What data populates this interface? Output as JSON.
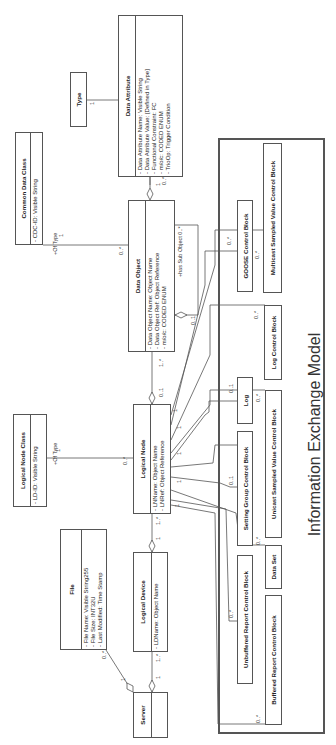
{
  "diagram": {
    "title": "Information Exchange Model",
    "classes": {
      "data_attribute": {
        "name": "Data Attribute",
        "attributes": [
          "-  Data Attribute Name:  Visible String",
          "-  Data Attribute Value:  [Defined in Type]",
          "-  Functional Constraint:  FC",
          "-  m/o/c:  CODED ENUM",
          "-  TrioOp:  Trigger Condition"
        ]
      },
      "type": {
        "name": "Type"
      },
      "common_data_class": {
        "name": "Common Data Class",
        "attributes": [
          "-  CDC-ID:  Visible String"
        ]
      },
      "data_object": {
        "name": "Data Object",
        "attributes": [
          "-  Data Object Name:  Object Name",
          "-  Data Object Ref:  Object Reference",
          "-  m/o/c:  CODED ENUM"
        ]
      },
      "logical_node_class": {
        "name": "Logical Node Class",
        "attributes": [
          "-  LD-ID:  Visible String"
        ]
      },
      "logical_node": {
        "name": "Logical Node",
        "attributes": [
          "-  LNName:  Object Name",
          "-  LNRef:  Object Reference"
        ]
      },
      "file": {
        "name": "File",
        "attributes": [
          "-  File Name:  Visible String255",
          "-  File Size:  INT32U",
          "-  Last Modified:  Time Stamp"
        ]
      },
      "logical_device": {
        "name": "Logical Device",
        "attributes": [
          "-  LDName:  Object Name"
        ]
      },
      "server": {
        "name": "Server"
      }
    },
    "exchange_blocks": {
      "msvcb": "Multicast Sampled Value Control Block",
      "goose": "GOOSE Control Block",
      "logcb": "Log Control Block",
      "log": "Log",
      "usvcb": "Unicast Sampled Value Control Block",
      "sgcb": "Setting Group Control Block",
      "dataset": "Data Set",
      "urcb": "Unbuffered Report Control Block",
      "brcb": "Buffered Report Control Block"
    },
    "labels": {
      "type_mult": "1",
      "da_mult_1": "1",
      "da_mult_0n": "0..*",
      "cdc_of_type": "+Of Type",
      "cdc_mult": "1",
      "do_cdc_mult": "0..*",
      "has_sub_object": "+has Sub Object 0..*",
      "sub_object_mult": "0..1",
      "ln_do_01": "0..1",
      "ln_do_1n": "1..*",
      "lnc_of_type": "+Of Type",
      "lnc_mult": "1",
      "ln_lnc_mult": "0..*",
      "ld_ln_1": "1",
      "ld_ln_1n": "1..*",
      "server_ld_1": "1",
      "server_ld_1n": "1..*",
      "server_file_1": "1",
      "server_file_0n": "0..*",
      "goose_mult": "0..*",
      "msvcb_mult": "0..*",
      "logcb_mult": "0..*",
      "log_mult": "0..1",
      "usvcb_mult": "0..*",
      "sgcb_mult": "0..1",
      "dataset_mult": "0..*",
      "urcb_mult": "0..*",
      "brcb_mult": "0..*",
      "ln_end_1": "1"
    }
  }
}
